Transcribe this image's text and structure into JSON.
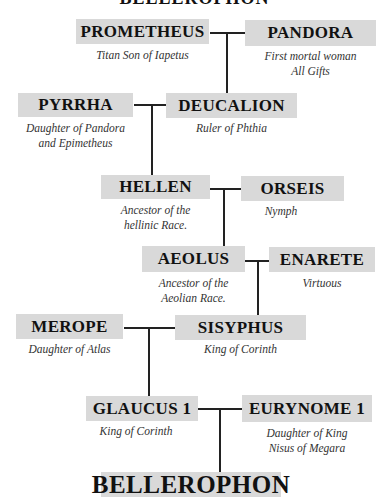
{
  "title": "BELLEROPHON",
  "people": {
    "prometheus": {
      "name": "PROMETHEUS",
      "desc": [
        "Titan Son of Iapetus"
      ]
    },
    "pandora": {
      "name": "PANDORA",
      "desc": [
        "First mortal woman",
        "All Gifts"
      ]
    },
    "pyrrha": {
      "name": "PYRRHA",
      "desc": [
        "Daughter of Pandora",
        "and Epimetheus"
      ]
    },
    "deucalion": {
      "name": "DEUCALION",
      "desc": [
        "Ruler of Phthia"
      ]
    },
    "hellen": {
      "name": "HELLEN",
      "desc": [
        "Ancestor of the",
        "hellinic Race."
      ]
    },
    "orseis": {
      "name": "ORSEIS",
      "desc": [
        "Nymph"
      ]
    },
    "aeolus": {
      "name": "AEOLUS",
      "desc": [
        "Ancestor of the",
        "Aeolian Race."
      ]
    },
    "enarete": {
      "name": "ENARETE",
      "desc": [
        "Virtuous"
      ]
    },
    "merope": {
      "name": "MEROPE",
      "desc": [
        "Daughter of Atlas"
      ]
    },
    "sisyphus": {
      "name": "SISYPHUS",
      "desc": [
        "King of Corinth"
      ]
    },
    "glaucus": {
      "name": "GLAUCUS 1",
      "desc": [
        "King of Corinth"
      ]
    },
    "eurynome": {
      "name": "EURYNOME 1",
      "desc": [
        "Daughter of King",
        "Nisus of Megara"
      ]
    },
    "bellerophon": {
      "name": "BELLEROPHON"
    }
  },
  "colors": {
    "box_bg": "#d9d9d9",
    "line": "#222222",
    "text": "#111111"
  }
}
